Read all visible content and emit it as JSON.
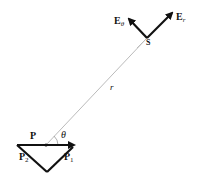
{
  "diagram": {
    "type": "physics-vector-diagram",
    "colors": {
      "vectors": "#111111",
      "radial_line": "#bbbbbb",
      "background": "#ffffff"
    },
    "labels": {
      "dipole": "P",
      "p1": "P",
      "p1_sub": "1",
      "p2": "P",
      "p2_sub": "2",
      "theta": "θ",
      "r": "r",
      "source_point": "S",
      "e_theta": "E",
      "e_theta_sub": "θ",
      "e_r": "E",
      "e_r_sub": "r"
    },
    "points": {
      "origin": [
        46,
        145
      ],
      "S": [
        147,
        38
      ],
      "p_left": [
        17,
        145
      ],
      "p_right": [
        75,
        145
      ],
      "p_bottom": [
        47,
        172
      ],
      "er_tip": [
        174,
        12
      ],
      "etheta_tip": [
        127,
        17
      ]
    }
  }
}
